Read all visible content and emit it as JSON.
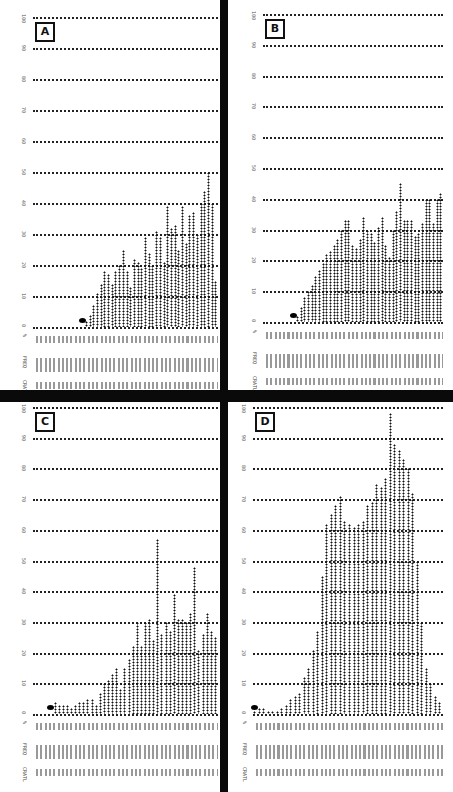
{
  "figure": {
    "panel_labels": [
      "A",
      "B",
      "C",
      "D"
    ],
    "y_ticks": [
      "0",
      "10",
      "20",
      "30",
      "40",
      "50",
      "60",
      "70",
      "80",
      "90",
      "100"
    ],
    "row_labels": [
      "%",
      "FREQ",
      "CRATL"
    ]
  },
  "colors": {
    "ink": "#111111",
    "divider": "#0a0a0a",
    "background": "#ffffff"
  },
  "chart_data": [
    {
      "panel": "A",
      "type": "bar",
      "title": "A",
      "xlabel": "",
      "ylabel": "%",
      "ylim": [
        0,
        100
      ],
      "grid": true,
      "values": [
        0,
        0,
        0,
        0,
        0,
        0,
        0,
        0,
        0,
        0,
        0,
        0,
        0,
        0,
        2,
        4,
        7,
        11,
        14,
        18,
        17,
        14,
        18,
        20,
        25,
        18,
        13,
        22,
        21,
        19,
        29,
        24,
        20,
        31,
        29,
        21,
        39,
        32,
        33,
        25,
        39,
        27,
        36,
        37,
        30,
        40,
        44,
        50,
        40,
        15
      ]
    },
    {
      "panel": "B",
      "type": "bar",
      "title": "B",
      "xlabel": "",
      "ylabel": "%",
      "ylim": [
        0,
        100
      ],
      "grid": true,
      "values": [
        0,
        0,
        0,
        0,
        0,
        0,
        0,
        0,
        0,
        2,
        5,
        8,
        10,
        12,
        15,
        17,
        19,
        22,
        23,
        25,
        27,
        30,
        33,
        33,
        25,
        24,
        27,
        34,
        30,
        29,
        26,
        31,
        34,
        25,
        21,
        30,
        36,
        45,
        33,
        33,
        33,
        28,
        29,
        32,
        40,
        40,
        32,
        40,
        42
      ]
    },
    {
      "panel": "C",
      "type": "bar",
      "title": "C",
      "xlabel": "",
      "ylabel": "%",
      "ylim": [
        0,
        100
      ],
      "grid": true,
      "values": [
        0,
        0,
        0,
        0,
        0,
        4,
        3,
        3,
        3,
        2,
        3,
        4,
        4,
        5,
        5,
        3,
        7,
        10,
        11,
        13,
        15,
        8,
        15,
        18,
        22,
        30,
        22,
        30,
        31,
        24,
        57,
        26,
        30,
        27,
        39,
        31,
        31,
        30,
        33,
        48,
        21,
        26,
        33,
        27,
        25
      ]
    },
    {
      "panel": "D",
      "type": "bar",
      "title": "D",
      "xlabel": "",
      "ylabel": "%",
      "ylim": [
        0,
        100
      ],
      "grid": true,
      "values": [
        1,
        2,
        2,
        1,
        1,
        1,
        2,
        3,
        5,
        6,
        7,
        12,
        15,
        21,
        27,
        45,
        62,
        65,
        68,
        71,
        63,
        62,
        61,
        62,
        63,
        68,
        69,
        75,
        74,
        77,
        98,
        88,
        86,
        83,
        80,
        72,
        50,
        30,
        15,
        10,
        6,
        4
      ]
    }
  ]
}
